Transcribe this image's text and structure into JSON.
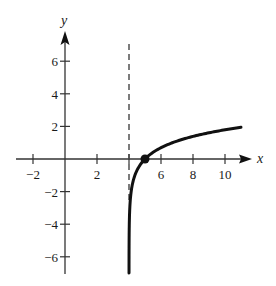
{
  "chart_data": {
    "type": "line",
    "title": "",
    "xlabel": "x",
    "ylabel": "y",
    "xlim": [
      -3,
      11.5
    ],
    "ylim": [
      -7,
      7.5
    ],
    "grid": false,
    "x_ticks": [
      -2,
      2,
      4,
      6,
      8,
      10
    ],
    "x_tick_labels": [
      "−2",
      "2",
      "",
      "6",
      "8",
      "10"
    ],
    "y_ticks": [
      6,
      4,
      2,
      -2,
      -4,
      -6
    ],
    "y_tick_labels": [
      "6",
      "4",
      "2",
      "−2",
      "−4",
      "−6"
    ],
    "series": [
      {
        "name": "y = ln(x − 4)",
        "function": "ln(x-4)",
        "x": [
          4.0009,
          4.01,
          4.05,
          4.1,
          4.25,
          4.5,
          5,
          6,
          7,
          8,
          9,
          10,
          11
        ],
        "values": [
          -7,
          -4.61,
          -3.0,
          -2.3,
          -1.39,
          -0.69,
          0,
          0.69,
          1.1,
          1.39,
          1.61,
          1.79,
          1.95
        ]
      }
    ],
    "asymptote": {
      "type": "vertical",
      "x": 4,
      "style": "dashed"
    },
    "points": [
      {
        "x": 5,
        "y": 0,
        "label": ""
      }
    ],
    "colors": {
      "curve": "#111111",
      "axis": "#333333",
      "asymptote": "#444444"
    }
  }
}
